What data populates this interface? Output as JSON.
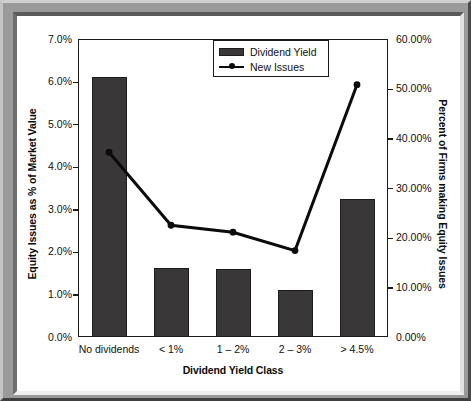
{
  "chart_data": {
    "type": "bar",
    "title": "",
    "subtitle": "",
    "xlabel": "Dividend Yield Class",
    "ylabel": "Equity Issues as % of Market Value",
    "y2label": "Percent of Firms making Equity Issues",
    "categories": [
      "No dividends",
      "< 1%",
      "1 – 2%",
      "2 – 3%",
      "> 4.5%"
    ],
    "series": [
      {
        "name": "Dividend Yield",
        "type": "bar",
        "axis": "left",
        "color": "#3a3738",
        "values": [
          6.1,
          1.63,
          1.6,
          1.1,
          3.25
        ],
        "value_labels": [
          "6.1%",
          "1.63%",
          "1.6%",
          "1.1%",
          "3.25%"
        ]
      },
      {
        "name": "New Issues",
        "type": "line",
        "axis": "right",
        "color": "#0b0b0b",
        "values": [
          37.2,
          22.5,
          21.1,
          17.4,
          50.8
        ],
        "value_labels": [
          "37.20%",
          "22.50%",
          "21.10%",
          "17.40%",
          "50.80%"
        ]
      }
    ],
    "ylim": [
      0,
      7
    ],
    "y2lim": [
      0,
      60
    ],
    "yticks": [
      0,
      1,
      2,
      3,
      4,
      5,
      6,
      7
    ],
    "ytick_labels": [
      "0.0%",
      "1.0%",
      "2.0%",
      "3.0%",
      "4.0%",
      "5.0%",
      "6.0%",
      "7.0%"
    ],
    "y2ticks": [
      0,
      10,
      20,
      30,
      40,
      50,
      60
    ],
    "y2tick_labels": [
      "0.00%",
      "10.00%",
      "20.00%",
      "30.00%",
      "40.00%",
      "50.00%",
      "60.00%"
    ],
    "grid": false,
    "legend_position": "top-center",
    "legend_entries": [
      "Dividend Yield",
      "New Issues"
    ]
  }
}
